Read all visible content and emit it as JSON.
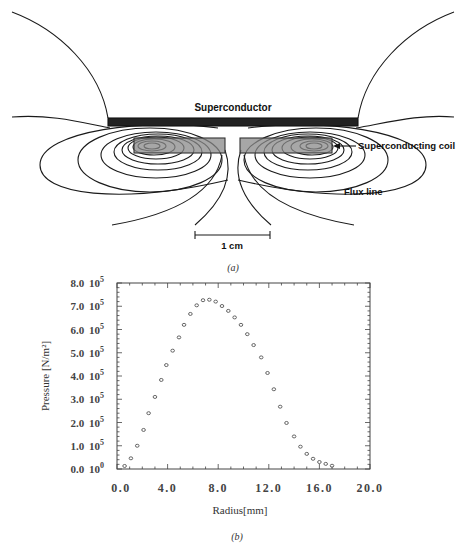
{
  "figure_a": {
    "caption": "(a)",
    "labels": {
      "superconductor": "Superconductor",
      "coil": "Superconducting coil",
      "flux": "Flux line",
      "scale": "1 cm"
    }
  },
  "figure_b": {
    "caption": "(b)"
  },
  "chart_data": {
    "type": "scatter",
    "title": "",
    "xlabel": "Radius[mm]",
    "ylabel": "Pressure [N/m²]",
    "xlim": [
      0,
      20
    ],
    "ylim": [
      0,
      800000
    ],
    "x_ticks": [
      0,
      4,
      8,
      12,
      16,
      20
    ],
    "x_tick_labels": [
      "0.0",
      "4.0",
      "8.0",
      "12.0",
      "16.0",
      "20.0"
    ],
    "y_ticks": [
      0,
      100000,
      200000,
      300000,
      400000,
      500000,
      600000,
      700000,
      800000
    ],
    "y_tick_labels": [
      {
        "m": "0.0",
        "b": "10",
        "e": "0"
      },
      {
        "m": "1.0",
        "b": "10",
        "e": "5"
      },
      {
        "m": "2.0",
        "b": "10",
        "e": "5"
      },
      {
        "m": "3.0",
        "b": "10",
        "e": "5"
      },
      {
        "m": "4.0",
        "b": "10",
        "e": "5"
      },
      {
        "m": "5.0",
        "b": "10",
        "e": "5"
      },
      {
        "m": "6.0",
        "b": "10",
        "e": "5"
      },
      {
        "m": "7.0",
        "b": "10",
        "e": "5"
      },
      {
        "m": "8.0",
        "b": "10",
        "e": "5"
      }
    ],
    "grid": false,
    "marker": "open-circle",
    "series": [
      {
        "name": "Pressure",
        "x": [
          0.6,
          1.1,
          1.6,
          2.1,
          2.5,
          3.0,
          3.5,
          3.9,
          4.4,
          4.9,
          5.3,
          5.8,
          6.3,
          6.8,
          7.3,
          7.8,
          8.3,
          8.8,
          9.3,
          9.8,
          10.3,
          10.8,
          11.4,
          11.9,
          12.4,
          12.9,
          13.4,
          14.0,
          14.5,
          15.0,
          15.5,
          16.0,
          16.5,
          17.0
        ],
        "y": [
          13000,
          46000,
          100000,
          168000,
          240000,
          310000,
          383000,
          447000,
          509000,
          566000,
          620000,
          667000,
          704000,
          726000,
          728000,
          720000,
          701000,
          680000,
          652000,
          620000,
          580000,
          533000,
          480000,
          413000,
          343000,
          268000,
          198000,
          140000,
          96000,
          65000,
          44000,
          30000,
          22000,
          14000
        ]
      }
    ]
  }
}
